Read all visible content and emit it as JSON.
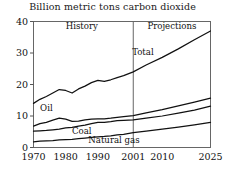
{
  "chart_data": {
    "type": "line",
    "title": "Billion metric tons carbon dioxide",
    "xlabel": "",
    "ylabel": "",
    "xlim": [
      1970,
      2025
    ],
    "ylim": [
      0,
      40
    ],
    "yticks": [
      0,
      10,
      20,
      30,
      40
    ],
    "xticks": [
      1970,
      1980,
      1990,
      2001,
      2010,
      2025
    ],
    "grid": false,
    "legend": "inline-labels",
    "divider_year": 2001,
    "annotations": [
      {
        "text": "History",
        "x": 1985,
        "y": 37.5
      },
      {
        "text": "Projections",
        "x": 2013,
        "y": 37.5
      },
      {
        "text": "Total",
        "x": 2004,
        "y": 29.5
      },
      {
        "text": "Oil",
        "x": 1974,
        "y": 11.5
      },
      {
        "text": "Coal",
        "x": 1985,
        "y": 4.2
      },
      {
        "text": "Natural gas",
        "x": 1995,
        "y": 1.3
      }
    ],
    "x": [
      1970,
      1972,
      1974,
      1976,
      1978,
      1980,
      1982,
      1984,
      1986,
      1988,
      1990,
      1992,
      1994,
      1996,
      1998,
      2001,
      2005,
      2010,
      2015,
      2020,
      2025
    ],
    "series": [
      {
        "name": "Total",
        "values": [
          14.0,
          15.3,
          16.2,
          17.3,
          18.4,
          18.1,
          17.3,
          18.6,
          19.5,
          20.6,
          21.3,
          21.0,
          21.5,
          22.2,
          22.8,
          24.0,
          26.2,
          28.6,
          31.3,
          34.2,
          37.0
        ]
      },
      {
        "name": "Oil",
        "values": [
          6.8,
          7.6,
          8.0,
          8.7,
          9.3,
          9.0,
          8.3,
          8.4,
          8.8,
          9.0,
          9.1,
          9.1,
          9.3,
          9.6,
          9.8,
          10.1,
          11.0,
          12.0,
          13.2,
          14.4,
          15.7
        ]
      },
      {
        "name": "Coal",
        "values": [
          5.2,
          5.3,
          5.4,
          5.6,
          5.8,
          6.2,
          6.4,
          6.8,
          7.1,
          7.6,
          8.0,
          8.0,
          8.2,
          8.5,
          8.6,
          8.8,
          9.3,
          10.0,
          10.9,
          11.9,
          13.1
        ]
      },
      {
        "name": "Natural gas",
        "values": [
          1.8,
          2.0,
          2.1,
          2.2,
          2.4,
          2.5,
          2.6,
          2.8,
          3.0,
          3.2,
          3.4,
          3.5,
          3.7,
          4.0,
          4.2,
          4.7,
          5.2,
          5.8,
          6.5,
          7.2,
          8.0
        ]
      }
    ]
  }
}
